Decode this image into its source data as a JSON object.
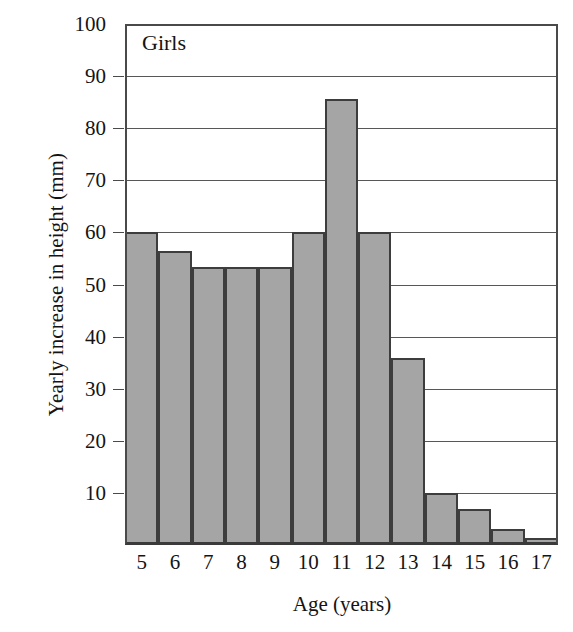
{
  "chart_data": {
    "type": "bar",
    "title": "",
    "annotation": "Girls",
    "xlabel": "Age (years)",
    "ylabel": "Yearly increase in height (mm)",
    "categories": [
      "5",
      "6",
      "7",
      "8",
      "9",
      "10",
      "11",
      "12",
      "13",
      "14",
      "15",
      "16",
      "17"
    ],
    "values": [
      60.0,
      56.5,
      53.3,
      53.3,
      53.3,
      60.0,
      85.7,
      60.0,
      35.8,
      10.0,
      7.0,
      3.0,
      1.3
    ],
    "ylim": [
      0,
      100
    ],
    "xlim_categories": 13,
    "y_ticks": [
      10,
      20,
      30,
      40,
      50,
      60,
      70,
      80,
      90,
      100
    ],
    "y_tick_labels": [
      "10",
      "20",
      "30",
      "40",
      "50",
      "60",
      "70",
      "80",
      "90",
      "100"
    ],
    "grid": true,
    "grid_axis": "y",
    "legend": false,
    "legend_position": "none",
    "bar_fill_color": "#a5a5a5",
    "bar_edge_color": "#3d3d3d",
    "axis_color": "#4a4a4a",
    "grid_color": "#575757",
    "background_color": "#ffffff"
  },
  "figure": {
    "series_label": "Girls",
    "y_axis_title": "Yearly increase in height (mm)",
    "x_axis_title": "Age (years)"
  }
}
